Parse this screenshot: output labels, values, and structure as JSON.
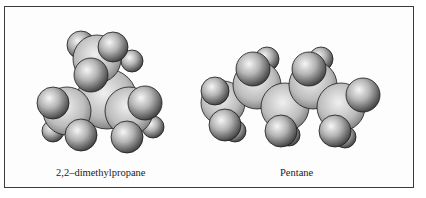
{
  "figure": {
    "panels": [
      {
        "id": "left",
        "caption": "2,2–dimethylpropane",
        "model": "space-filling",
        "structure": "branched"
      },
      {
        "id": "right",
        "caption": "Pentane",
        "model": "space-filling",
        "structure": "linear-chain"
      }
    ],
    "colors": {
      "border": "#3a3a3a",
      "sphere_highlight": "#f4f4f4",
      "sphere_mid": "#a8a8a8",
      "sphere_shadow": "#3c3c3c",
      "outline": "#1a1a1a"
    }
  }
}
